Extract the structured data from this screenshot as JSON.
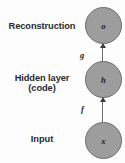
{
  "diagram": {
    "type": "autoencoder-block-diagram",
    "background_color": "#fdfdfd",
    "node_fill": "#9d9d9d",
    "node_stroke": "#6f6f6f",
    "text_color": "#2b2b2b",
    "stages": [
      {
        "id": "reconstruction",
        "label": "Reconstruction",
        "label_line2": "",
        "node_symbol": "o"
      },
      {
        "id": "hidden",
        "label": "Hidden layer",
        "label_line2": "(code)",
        "node_symbol": "h"
      },
      {
        "id": "input",
        "label": "Input",
        "label_line2": "",
        "node_symbol": "x"
      }
    ],
    "arrows": [
      {
        "id": "decoder",
        "label": "g",
        "from": "hidden",
        "to": "reconstruction"
      },
      {
        "id": "encoder",
        "label": "f",
        "from": "input",
        "to": "hidden"
      }
    ]
  }
}
